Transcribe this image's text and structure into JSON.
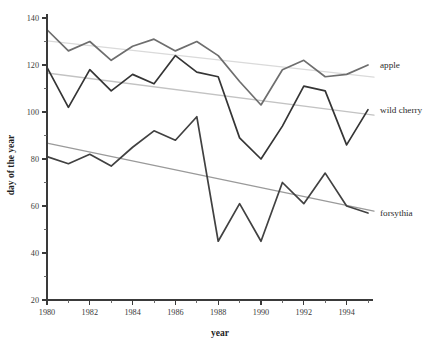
{
  "chart_data": {
    "type": "line",
    "title": "",
    "xlabel": "year",
    "ylabel": "day of the year",
    "xlim": [
      1980,
      1995
    ],
    "ylim": [
      20,
      140
    ],
    "grid": false,
    "legend_position": "right-inline-labels",
    "x": [
      1980,
      1981,
      1982,
      1983,
      1984,
      1985,
      1986,
      1987,
      1988,
      1989,
      1990,
      1991,
      1992,
      1993,
      1994,
      1995
    ],
    "x_tick_labels": [
      "1980",
      "1982",
      "1984",
      "1986",
      "1988",
      "1990",
      "1992",
      "1994"
    ],
    "x_tick_values": [
      1980,
      1982,
      1984,
      1986,
      1988,
      1990,
      1992,
      1994
    ],
    "x_minor_tick_values": [
      1981,
      1983,
      1985,
      1987,
      1989,
      1991,
      1993,
      1995
    ],
    "y_tick_labels": [
      "20",
      "40",
      "60",
      "80",
      "100",
      "120",
      "140"
    ],
    "y_tick_values": [
      20,
      40,
      60,
      80,
      100,
      120,
      140
    ],
    "y_minor_tick_values": [
      30,
      50,
      70,
      90,
      110,
      130
    ],
    "series": [
      {
        "name": "apple",
        "color": "#6e6e6e",
        "label": "apple",
        "values": [
          135,
          126,
          130,
          122,
          128,
          131,
          126,
          130,
          124,
          113,
          103,
          118,
          122,
          115,
          116,
          120
        ]
      },
      {
        "name": "wild cherry",
        "color": "#353535",
        "label": "wild cherry",
        "values": [
          119,
          102,
          118,
          109,
          116,
          112,
          124,
          117,
          115,
          89,
          80,
          94,
          111,
          109,
          86,
          101
        ]
      },
      {
        "name": "forsythia",
        "color": "#414141",
        "label": "forsythia",
        "values": [
          81,
          78,
          82,
          77,
          85,
          92,
          88,
          98,
          45,
          61,
          45,
          70,
          61,
          74,
          60,
          57
        ]
      }
    ],
    "trends": [
      {
        "name": "apple-trend",
        "color": "#dadada",
        "start_value": 130.3,
        "end_value": 114.8
      },
      {
        "name": "wild-cherry-trend",
        "color": "#c3c3c3",
        "start_value": 116.6,
        "end_value": 98.7
      },
      {
        "name": "forsythia-trend",
        "color": "#9a9a9a",
        "start_value": 86.8,
        "end_value": 57.8
      }
    ]
  },
  "axis": {
    "x_title": "year",
    "y_title": "day of the year"
  },
  "colors": {
    "background": "#ffffff",
    "axis": "#3a3a3a",
    "text": "#2b2b2b"
  }
}
